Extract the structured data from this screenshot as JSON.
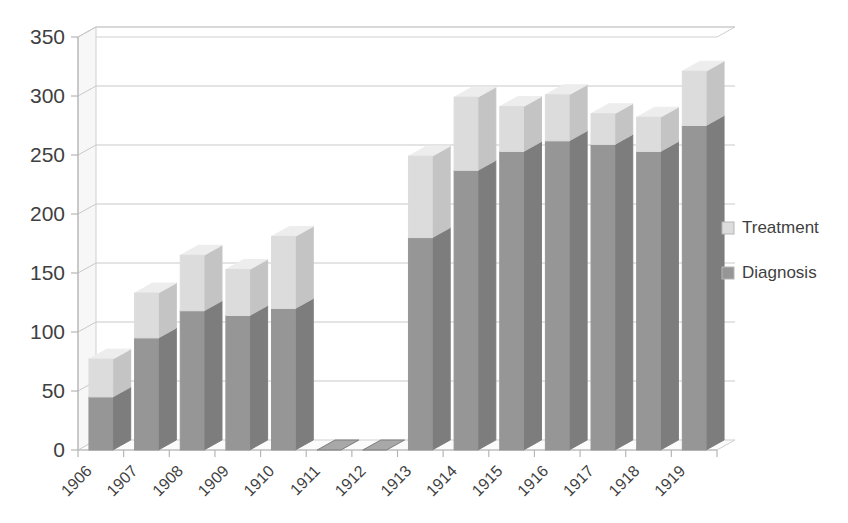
{
  "chart_data": {
    "type": "bar",
    "subtype": "stacked-column-3d",
    "title": "",
    "xlabel": "",
    "ylabel": "",
    "categories": [
      "1906",
      "1907",
      "1908",
      "1909",
      "1910",
      "1911",
      "1912",
      "1913",
      "1914",
      "1915",
      "1916",
      "1917",
      "1918",
      "1919"
    ],
    "series": [
      {
        "name": "Diagnosis",
        "color": "#969696",
        "values": [
          45,
          95,
          118,
          114,
          120,
          0,
          0,
          180,
          237,
          253,
          262,
          259,
          253,
          275
        ]
      },
      {
        "name": "Treatment",
        "color": "#dcdcdc",
        "values": [
          32,
          38,
          47,
          39,
          61,
          0,
          0,
          69,
          62,
          38,
          39,
          26,
          29,
          46
        ]
      }
    ],
    "totals": [
      77,
      133,
      165,
      153,
      181,
      0,
      0,
      249,
      299,
      291,
      301,
      285,
      282,
      321
    ],
    "ylim": [
      0,
      350
    ],
    "yticks": [
      0,
      50,
      100,
      150,
      200,
      250,
      300,
      350
    ],
    "ytick_labels": [
      "0",
      "50",
      "100",
      "150",
      "200",
      "250",
      "300",
      "350"
    ],
    "grid": true,
    "legend_position": "right",
    "legend_entries": [
      "Treatment",
      "Diagnosis"
    ]
  },
  "legend": {
    "items": [
      {
        "label": "Treatment",
        "color": "#dcdcdc"
      },
      {
        "label": "Diagnosis",
        "color": "#969696"
      }
    ]
  },
  "axis": {
    "y_labels": [
      "350",
      "300",
      "250",
      "200",
      "150",
      "100",
      "50",
      "0"
    ],
    "x_labels": [
      "1906",
      "1907",
      "1908",
      "1909",
      "1910",
      "1911",
      "1912",
      "1913",
      "1914",
      "1915",
      "1916",
      "1917",
      "1918",
      "1919"
    ]
  },
  "colors": {
    "treatment": "#dcdcdc",
    "treatment_side": "#c4c4c4",
    "treatment_top": "#ededed",
    "diagnosis": "#969696",
    "diagnosis_side": "#7d7d7d",
    "diagnosis_top": "#a8a8a8",
    "gridline": "#c9c9c9",
    "axis": "#b6b6b6",
    "text": "#3f3f3f",
    "background": "#ffffff"
  }
}
